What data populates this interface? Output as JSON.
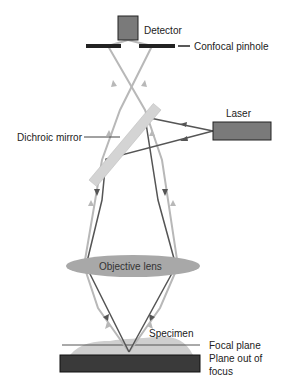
{
  "diagram": {
    "labels": {
      "detector": "Detector",
      "pinhole": "Confocal pinhole",
      "laser": "Laser",
      "dichroic": "Dichroic mirror",
      "objective": "Objective lens",
      "specimen": "Specimen",
      "focal_plane": "Focal plane",
      "out_of_focus_1": "Plane out of",
      "out_of_focus_2": "focus"
    },
    "colors": {
      "excitation_beam": "#555555",
      "emission_beam": "#b8b8b8",
      "detector_fill": "#7a7a7a",
      "laser_fill": "#7a7a7a",
      "mirror_fill": "#d4d4d4",
      "lens_fill": "#a8a8a8",
      "slide_fill": "#3a3a3a",
      "specimen_fill": "#cfcfcf"
    }
  }
}
